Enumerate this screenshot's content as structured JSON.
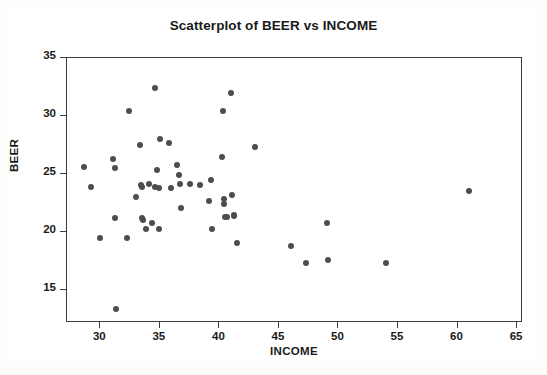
{
  "figure": {
    "background": "#ffffff",
    "frame_color": "#6e6e6e"
  },
  "axis_labels": {
    "x": "INCOME",
    "y": "BEER"
  },
  "chart_data": {
    "type": "scatter",
    "title": "Scatterplot of BEER vs INCOME",
    "xlabel": "INCOME",
    "ylabel": "BEER",
    "xlim": [
      27.2,
      65.5
    ],
    "ylim": [
      12.2,
      35.0
    ],
    "xticks": [
      30,
      35,
      40,
      45,
      50,
      55,
      60,
      65
    ],
    "yticks": [
      15,
      20,
      25,
      30,
      35
    ],
    "grid": false,
    "legend": null,
    "marker": {
      "shape": "circle",
      "color": "#4d4d4d",
      "size_px": 6
    },
    "n_points": 52,
    "x": [
      28.6,
      29.2,
      30.0,
      31.1,
      31.2,
      31.2,
      31.3,
      32.2,
      32.4,
      33.0,
      33.3,
      33.4,
      33.5,
      33.5,
      33.6,
      33.8,
      34.1,
      34.3,
      34.6,
      34.6,
      34.8,
      34.9,
      34.9,
      35.0,
      35.8,
      35.9,
      36.4,
      36.6,
      36.7,
      36.8,
      37.5,
      38.4,
      39.1,
      39.3,
      39.4,
      40.2,
      40.3,
      40.4,
      40.4,
      40.5,
      40.6,
      41.0,
      41.1,
      41.2,
      41.2,
      41.5,
      43.0,
      46.0,
      47.3,
      49.0,
      49.1,
      54.0,
      61.0
    ],
    "y": [
      25.6,
      23.9,
      19.5,
      26.3,
      25.5,
      21.2,
      13.4,
      19.5,
      30.4,
      23.0,
      27.5,
      24.1,
      23.9,
      21.2,
      21.1,
      20.3,
      24.2,
      20.8,
      32.4,
      23.9,
      25.4,
      23.8,
      20.3,
      28.0,
      27.7,
      23.8,
      25.8,
      24.9,
      24.2,
      22.1,
      24.2,
      24.1,
      22.7,
      24.5,
      20.3,
      26.5,
      30.4,
      22.9,
      22.4,
      21.3,
      21.3,
      32.0,
      23.2,
      21.5,
      21.4,
      19.1,
      27.3,
      18.8,
      17.4,
      20.8,
      17.6,
      17.4,
      23.6
    ]
  }
}
